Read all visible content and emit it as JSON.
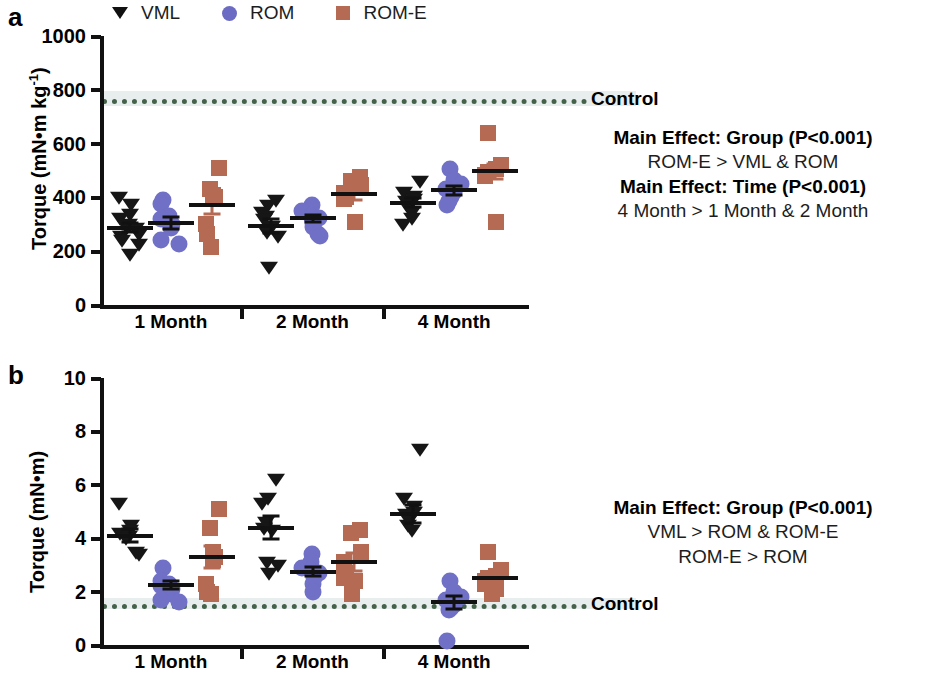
{
  "figure": {
    "panels": [
      {
        "letter": "a",
        "ylabel_main": "Torque (mN•m kg",
        "ylabel_sup": "-1",
        "ylabel_close": ")",
        "ylabel_full": "Torque (mN•m kg-1)",
        "control_label": "Control"
      },
      {
        "letter": "b",
        "ylabel_main": "Torque (mN•m)",
        "ylabel_sup": "",
        "ylabel_close": "",
        "ylabel_full": "Torque (mN•m)",
        "control_label": "Control"
      }
    ]
  },
  "legend": {
    "entries": [
      {
        "label": "VML",
        "marker": "triangle-down-icon",
        "color": "#111111"
      },
      {
        "label": "ROM",
        "marker": "circle-icon",
        "color": "#6b6bc4"
      },
      {
        "label": "ROM-E",
        "marker": "square-icon",
        "color": "#b56a54"
      }
    ]
  },
  "stats_a": {
    "lines": [
      {
        "text": "Main Effect:  Group (P<0.001)",
        "bold": true
      },
      {
        "text": "ROM-E > VML & ROM",
        "bold": false
      },
      {
        "text": "Main Effect: Time (P<0.001)",
        "bold": true
      },
      {
        "text": "4 Month > 1 Month & 2 Month",
        "bold": false
      }
    ]
  },
  "stats_b": {
    "lines": [
      {
        "text": "Main Effect:  Group (P<0.001)",
        "bold": true
      },
      {
        "text": "VML > ROM & ROM-E",
        "bold": false
      },
      {
        "text": "ROM-E > ROM",
        "bold": false
      }
    ]
  },
  "chart_data": [
    {
      "panel": "a",
      "type": "scatter",
      "title": "",
      "xlabel": "",
      "ylabel": "Torque (mN•m kg-1)",
      "ylim": [
        0,
        1000
      ],
      "yticks": [
        0,
        200,
        400,
        600,
        800,
        1000
      ],
      "ytick_labels": [
        "0",
        "200",
        "400",
        "600",
        "800",
        "1000"
      ],
      "xtick_labels": [
        "1 Month",
        "2 Month",
        "4 Month"
      ],
      "grid": false,
      "legend_position": "top",
      "reference_line": {
        "label": "Control",
        "value": 765,
        "band": [
          740,
          795
        ],
        "style": "dotted",
        "color": "#44624a",
        "band_color": "#e7ecec"
      },
      "groups": [
        {
          "time": "1 Month",
          "series": [
            {
              "name": "VML",
              "values": [
                400,
                375,
                340,
                325,
                300,
                295,
                285,
                265,
                255,
                240,
                225,
                190
              ],
              "mean": 288,
              "sem": 18
            },
            {
              "name": "ROM",
              "values": [
                390,
                375,
                330,
                320,
                300,
                285,
                240,
                225
              ],
              "mean": 305,
              "sem": 22
            },
            {
              "name": "ROM-E",
              "values": [
                510,
                430,
                410,
                400,
                395,
                300,
                265,
                215
              ],
              "mean": 373,
              "sem": 36
            }
          ]
        },
        {
          "time": "2 Month",
          "series": [
            {
              "name": "VML",
              "values": [
                390,
                370,
                345,
                330,
                320,
                295,
                270,
                255,
                140
              ],
              "mean": 295,
              "sem": 26
            },
            {
              "name": "ROM",
              "values": [
                370,
                360,
                350,
                330,
                325,
                315,
                305,
                290,
                265,
                255
              ],
              "mean": 322,
              "sem": 13
            },
            {
              "name": "ROM-E",
              "values": [
                475,
                460,
                445,
                415,
                400,
                395,
                310
              ],
              "mean": 412,
              "sem": 21
            }
          ]
        },
        {
          "time": "4 Month",
          "series": [
            {
              "name": "VML",
              "values": [
                460,
                420,
                405,
                395,
                385,
                375,
                365,
                345,
                325,
                300
              ],
              "mean": 380,
              "sem": 16
            },
            {
              "name": "ROM",
              "values": [
                505,
                465,
                450,
                430,
                420,
                400,
                385,
                370
              ],
              "mean": 427,
              "sem": 17
            },
            {
              "name": "ROM-E",
              "values": [
                640,
                520,
                505,
                495,
                485,
                480,
                310
              ],
              "mean": 498,
              "sem": 28
            }
          ]
        }
      ]
    },
    {
      "panel": "b",
      "type": "scatter",
      "title": "",
      "xlabel": "",
      "ylabel": "Torque (mN•m)",
      "ylim": [
        0,
        10
      ],
      "yticks": [
        0,
        2,
        4,
        6,
        8,
        10
      ],
      "ytick_labels": [
        "0",
        "2",
        "4",
        "6",
        "8",
        "10"
      ],
      "xtick_labels": [
        "1 Month",
        "2 Month",
        "4 Month"
      ],
      "grid": false,
      "legend_position": "top",
      "reference_line": {
        "label": "Control",
        "value": 1.55,
        "band": [
          1.35,
          1.75
        ],
        "style": "dotted",
        "color": "#44624a",
        "band_color": "#e7ecec"
      },
      "groups": [
        {
          "time": "1 Month",
          "series": [
            {
              "name": "VML",
              "values": [
                5.3,
                4.5,
                4.3,
                4.2,
                4.1,
                4.0,
                3.5,
                3.4
              ],
              "mean": 4.1,
              "sem": 0.25
            },
            {
              "name": "ROM",
              "values": [
                2.9,
                2.4,
                2.3,
                2.2,
                2.1,
                1.9,
                1.7,
                1.6
              ],
              "mean": 2.25,
              "sem": 0.16
            },
            {
              "name": "ROM-E",
              "values": [
                5.1,
                4.4,
                3.5,
                3.3,
                3.2,
                2.3,
                2.0,
                1.9
              ],
              "mean": 3.3,
              "sem": 0.4
            }
          ]
        },
        {
          "time": "2 Month",
          "series": [
            {
              "name": "VML",
              "values": [
                6.2,
                5.5,
                5.3,
                4.6,
                4.4,
                4.3,
                3.1,
                3.0,
                2.7
              ],
              "mean": 4.4,
              "sem": 0.42
            },
            {
              "name": "ROM",
              "values": [
                3.4,
                3.1,
                2.9,
                2.8,
                2.7,
                2.5,
                2.3,
                2.0
              ],
              "mean": 2.75,
              "sem": 0.17
            },
            {
              "name": "ROM-E",
              "values": [
                4.3,
                4.2,
                3.5,
                3.1,
                2.7,
                2.5,
                2.4,
                1.9
              ],
              "mean": 3.1,
              "sem": 0.33
            }
          ]
        },
        {
          "time": "4 Month",
          "series": [
            {
              "name": "VML",
              "values": [
                7.35,
                5.5,
                5.2,
                5.0,
                4.9,
                4.7,
                4.5,
                4.3
              ],
              "mean": 4.9,
              "sem": 0.33
            },
            {
              "name": "ROM",
              "values": [
                2.4,
                2.0,
                1.8,
                1.7,
                1.5,
                1.4,
                1.3,
                0.15
              ],
              "mean": 1.6,
              "sem": 0.25
            },
            {
              "name": "ROM-E",
              "values": [
                3.5,
                2.8,
                2.6,
                2.5,
                2.4,
                2.3,
                2.1,
                1.9
              ],
              "mean": 2.5,
              "sem": 0.2
            }
          ]
        }
      ]
    }
  ]
}
